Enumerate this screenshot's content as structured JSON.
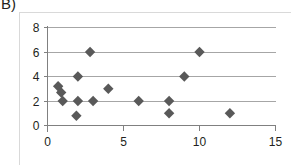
{
  "panel": {
    "label": "B)"
  },
  "colors": {
    "marker": "#595959",
    "gridline": "#a6a6a6",
    "axis": "#808080",
    "frame": "#d9d9d9",
    "text": "#231f20",
    "background": "#ffffff"
  },
  "chart_data": {
    "type": "scatter",
    "title": "",
    "subtitle": "",
    "xlabel": "",
    "ylabel": "",
    "xlim": [
      0,
      15
    ],
    "ylim": [
      0,
      8
    ],
    "xticks": [
      0,
      5,
      10,
      15
    ],
    "yticks": [
      0,
      2,
      4,
      6,
      8
    ],
    "xtick_labels": [
      "0",
      "5",
      "10",
      "15"
    ],
    "ytick_labels": [
      "0",
      "2",
      "4",
      "6",
      "8"
    ],
    "grid": "horizontal",
    "legend": "none",
    "marker_shape": "diamond",
    "marker_color": "#595959",
    "series": [
      {
        "name": "series-1",
        "points": [
          [
            0.7,
            3.2
          ],
          [
            0.9,
            2.7
          ],
          [
            1.0,
            2.0
          ],
          [
            2.0,
            4.0
          ],
          [
            2.0,
            2.0
          ],
          [
            1.9,
            0.8
          ],
          [
            2.8,
            6.0
          ],
          [
            3.0,
            2.0
          ],
          [
            4.0,
            3.0
          ],
          [
            6.0,
            2.0
          ],
          [
            8.0,
            2.0
          ],
          [
            8.0,
            1.0
          ],
          [
            9.0,
            4.0
          ],
          [
            10.0,
            6.0
          ],
          [
            12.0,
            1.0
          ]
        ]
      }
    ]
  }
}
